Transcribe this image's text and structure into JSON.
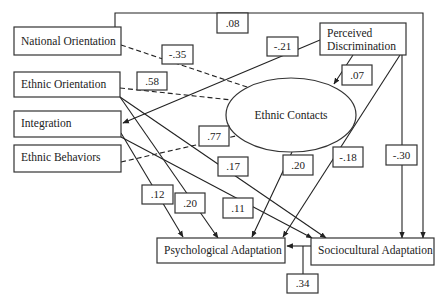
{
  "diagram": {
    "title": "",
    "nodes": {
      "national_orientation": "National Orientation",
      "ethnic_orientation": "Ethnic Orientation",
      "integration": "Integration",
      "ethnic_behaviors": "Ethnic Behaviors",
      "perceived_discrimination_line1": "Perceived",
      "perceived_discrimination_line2": "Discrimination",
      "ethnic_contacts": "Ethnic Contacts",
      "psychological_adaptation": "Psychological Adaptation",
      "sociocultural_adaptation": "Sociocultural Adaptation"
    },
    "coefficients": {
      "national_to_sociocultural": ".08",
      "national_to_ethnic_contacts": "-.35",
      "ethnic_orientation_to_ethnic_contacts": ".58",
      "perceived_discrimination_to_integration": "-.21",
      "perceived_discrimination_to_ethnic_contacts": ".07",
      "ethnic_behaviors_to_ethnic_contacts": ".77",
      "ethnic_orientation_to_sociocultural": ".17",
      "ethnic_contacts_to_psychological": ".20",
      "perceived_discrimination_to_psychological": "-.18",
      "perceived_discrimination_to_sociocultural": "-.30",
      "integration_to_psychological": ".12",
      "ethnic_orientation_to_psychological": ".20",
      "integration_to_sociocultural": ".11",
      "sociocultural_to_psychological": ".34"
    },
    "edges": [
      {
        "from": "National Orientation",
        "to": "Sociocultural Adaptation",
        "label": ".08",
        "style": "solid"
      },
      {
        "from": "National Orientation",
        "to": "Ethnic Contacts",
        "label": "-.35",
        "style": "dashed"
      },
      {
        "from": "Ethnic Orientation",
        "to": "Ethnic Contacts",
        "label": ".58",
        "style": "dashed"
      },
      {
        "from": "Perceived Discrimination",
        "to": "Integration",
        "label": "-.21",
        "style": "solid"
      },
      {
        "from": "Perceived Discrimination",
        "to": "Ethnic Contacts",
        "label": ".07",
        "style": "solid"
      },
      {
        "from": "Ethnic Behaviors",
        "to": "Ethnic Contacts",
        "label": ".77",
        "style": "dashed"
      },
      {
        "from": "Ethnic Orientation",
        "to": "Sociocultural Adaptation",
        "label": ".17",
        "style": "solid"
      },
      {
        "from": "Ethnic Contacts",
        "to": "Psychological Adaptation",
        "label": ".20",
        "style": "solid"
      },
      {
        "from": "Perceived Discrimination",
        "to": "Psychological Adaptation",
        "label": "-.18",
        "style": "solid"
      },
      {
        "from": "Perceived Discrimination",
        "to": "Sociocultural Adaptation",
        "label": "-.30",
        "style": "solid"
      },
      {
        "from": "Integration",
        "to": "Psychological Adaptation",
        "label": ".12",
        "style": "solid"
      },
      {
        "from": "Ethnic Orientation",
        "to": "Psychological Adaptation",
        "label": ".20",
        "style": "solid"
      },
      {
        "from": "Integration",
        "to": "Sociocultural Adaptation",
        "label": ".11",
        "style": "solid"
      },
      {
        "from": "Sociocultural Adaptation",
        "to": "Psychological Adaptation",
        "label": ".34",
        "style": "solid"
      }
    ]
  }
}
